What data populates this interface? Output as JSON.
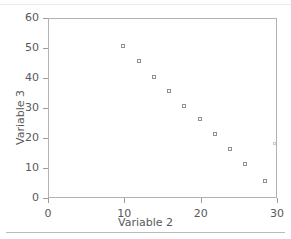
{
  "chart_data": {
    "type": "scatter",
    "title": "",
    "xlabel": "Variable 2",
    "ylabel": "Variable 3",
    "xlim": [
      0,
      30
    ],
    "ylim": [
      0,
      60
    ],
    "xticks": [
      0,
      10,
      20,
      30
    ],
    "yticks": [
      0,
      10,
      20,
      30,
      40,
      50,
      60
    ],
    "xtick_labels": [
      "0",
      "10",
      "20",
      "30"
    ],
    "ytick_labels": [
      "0",
      "10",
      "20",
      "30",
      "40",
      "50",
      "60"
    ],
    "grid": false,
    "legend": null,
    "marker": "open-square",
    "series": [
      {
        "name": "Variable 3 vs Variable 2",
        "points": [
          {
            "x": 10.0,
            "y": 50.5,
            "faint": false
          },
          {
            "x": 12.0,
            "y": 45.5,
            "faint": false
          },
          {
            "x": 14.0,
            "y": 40.0,
            "faint": false
          },
          {
            "x": 16.0,
            "y": 35.5,
            "faint": false
          },
          {
            "x": 18.0,
            "y": 30.5,
            "faint": false
          },
          {
            "x": 20.0,
            "y": 26.0,
            "faint": false
          },
          {
            "x": 22.0,
            "y": 21.0,
            "faint": false
          },
          {
            "x": 24.0,
            "y": 16.0,
            "faint": false
          },
          {
            "x": 26.0,
            "y": 11.0,
            "faint": false
          },
          {
            "x": 28.5,
            "y": 5.5,
            "faint": false
          },
          {
            "x": 29.8,
            "y": 18.0,
            "faint": true
          }
        ]
      }
    ]
  },
  "colors": {
    "axis": "#b0b3b6",
    "tick": "#9a9da0",
    "text": "#58595b",
    "marker": "#8e9194",
    "rule": "#b9bcbf",
    "background": "#ffffff"
  }
}
